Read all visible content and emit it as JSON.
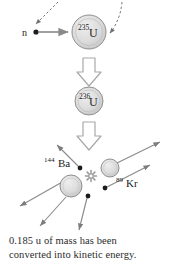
{
  "figure": {
    "background_color": "#ffffff"
  },
  "incoming": {
    "neutron_label": "n",
    "arrow_direction": "right"
  },
  "nuclei": [
    {
      "id": "u235",
      "mass_number": "235",
      "symbol": "U",
      "cx": 89,
      "cy": 32,
      "r": 17,
      "fill": "#d8d8d8"
    },
    {
      "id": "u236",
      "mass_number": "236",
      "symbol": "U",
      "cx": 89,
      "cy": 101,
      "r": 14,
      "fill": "#d8d8d8"
    }
  ],
  "products": [
    {
      "id": "ba144",
      "mass_number": "144",
      "symbol": "Ba",
      "label_x": 48,
      "label_y": 166,
      "cx": 71,
      "cy": 186,
      "r": 11,
      "fill": "#d8d8d8"
    },
    {
      "id": "kr89",
      "mass_number": "89",
      "symbol": "Kr",
      "label_x": 115,
      "label_y": 186,
      "cx": 110,
      "cy": 168,
      "r": 9,
      "fill": "#d8d8d8"
    }
  ],
  "energy_burst": {
    "name": "energy-release-starburst",
    "cx": 91,
    "cy": 176,
    "color": "#9a9a9a"
  },
  "emitted_neutrons": [
    {
      "dot_x": 80,
      "dot_y": 168,
      "tip_x": 55,
      "tip_y": 143
    },
    {
      "dot_x": 105,
      "dot_y": 188,
      "tip_x": 147,
      "tip_y": 166
    },
    {
      "dot_x": 88,
      "dot_y": 196,
      "tip_x": 76,
      "tip_y": 232
    }
  ],
  "colors": {
    "nucleus_fill": "#d8d8d8",
    "nucleus_stroke": "#8f8f8f",
    "arrow_gray": "#8a8a8a",
    "block_arrow_stroke": "#a8a8a8",
    "text": "#1c1c1c",
    "caption_text": "#2b2b2b"
  },
  "caption": {
    "line1": "0.185 u of mass has been",
    "line2": "converted into kinetic energy."
  }
}
